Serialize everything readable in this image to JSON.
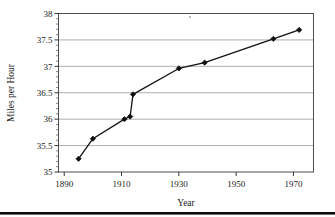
{
  "figure": {
    "background_color": "#ffffff",
    "footer_rule_color": "#000000"
  },
  "chart_data": {
    "type": "line",
    "title": "",
    "subtitle": "",
    "xlabel": "Year",
    "ylabel": "Miles per Hour",
    "xlim": [
      1888,
      1977
    ],
    "ylim": [
      35,
      38
    ],
    "xticks": [
      1890,
      1910,
      1930,
      1950,
      1970
    ],
    "xtick_labels": [
      "1890",
      "1910",
      "1930",
      "1950",
      "1970"
    ],
    "yticks": [
      35,
      35.5,
      36,
      36.5,
      37,
      37.5,
      38
    ],
    "ytick_labels": [
      "35",
      "35.5",
      "36",
      "36.5",
      "37",
      "37.5",
      "38"
    ],
    "grid": true,
    "grid_axis": "y",
    "grid_color": "#999999",
    "legend": false,
    "legend_position": "none",
    "marker": "diamond",
    "marker_color": "#111111",
    "line_color": "#111111",
    "x": [
      1895,
      1900,
      1911,
      1913,
      1914,
      1930,
      1939,
      1963,
      1972
    ],
    "y": [
      35.25,
      35.63,
      36.0,
      36.05,
      36.47,
      36.96,
      37.07,
      37.52,
      37.69
    ],
    "series": [
      {
        "name": "Miles per Hour",
        "values": [
          35.25,
          35.63,
          36.0,
          36.05,
          36.47,
          36.96,
          37.07,
          37.52,
          37.69
        ]
      }
    ],
    "points": [
      {
        "x": 1895,
        "y": 35.25
      },
      {
        "x": 1900,
        "y": 35.63
      },
      {
        "x": 1911,
        "y": 36.0
      },
      {
        "x": 1913,
        "y": 36.05
      },
      {
        "x": 1914,
        "y": 36.47
      },
      {
        "x": 1930,
        "y": 36.96
      },
      {
        "x": 1939,
        "y": 37.07
      },
      {
        "x": 1963,
        "y": 37.52
      },
      {
        "x": 1972,
        "y": 37.69
      }
    ]
  }
}
